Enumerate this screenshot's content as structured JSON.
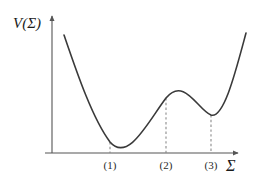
{
  "figure": {
    "background_color": "#ffffff",
    "width": 258,
    "height": 183
  },
  "axes": {
    "y_axis_label": "V(Σ)",
    "x_axis_label": "Σ",
    "axis_color": "#555555",
    "y_axis_x": 52,
    "x_axis_y": 153
  },
  "chart_data": {
    "type": "line",
    "title": "",
    "subtitle": "",
    "xlabel": "Σ",
    "ylabel": "V(Σ)",
    "grid": false,
    "legend": false,
    "legend_position": "none",
    "axis_arrows": {
      "x": "right",
      "y": "up"
    },
    "xlim": [
      0,
      258
    ],
    "ylim": [
      0,
      183
    ],
    "curve_color": "#3a3a3a",
    "curve_width": 1.6,
    "tick_labels": [
      "(1)",
      "(2)",
      "(3)"
    ],
    "tick_positions_px": [
      110,
      166,
      211
    ],
    "critical_points": [
      {
        "label": "(1)",
        "kind": "global-minimum",
        "x_px": 110,
        "y_px": 142
      },
      {
        "label": "(2)",
        "kind": "local-maximum",
        "x_px": 166,
        "y_px": 98
      },
      {
        "label": "(3)",
        "kind": "local-minimum",
        "x_px": 211,
        "y_px": 115
      }
    ],
    "curve_path": "M 64 35 C 76 70, 92 118, 110 142 C 128 163, 148 122, 166 98 C 184 76, 198 110, 211 115 C 224 119, 236 70, 246 33",
    "dashed_lines": [
      {
        "label": "(1)",
        "x_px": 110,
        "y_top_px": 142,
        "y_bottom_px": 153
      },
      {
        "label": "(2)",
        "x_px": 166,
        "y_top_px": 98,
        "y_bottom_px": 153
      },
      {
        "label": "(3)",
        "x_px": 211,
        "y_top_px": 115,
        "y_bottom_px": 153
      }
    ],
    "dash_color": "#8a8a8a",
    "x_axis": {
      "x_start": 45,
      "x_end": 240,
      "y": 153
    },
    "y_axis": {
      "x": 52,
      "y_start": 153,
      "y_end": 14
    }
  }
}
